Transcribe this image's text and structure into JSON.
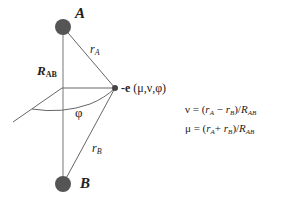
{
  "diagram": {
    "atoms": [
      {
        "id": "A",
        "label": "A",
        "cx": 63,
        "cy": 27,
        "r": 8,
        "color": "#555555"
      },
      {
        "id": "B",
        "label": "B",
        "cx": 63,
        "cy": 184,
        "r": 8,
        "color": "#555555"
      }
    ],
    "electron": {
      "label_prefix": "-e",
      "label_coords": "(μ,ν,φ)",
      "cx": 115,
      "cy": 88,
      "r": 3,
      "color": "#444444"
    },
    "labels": {
      "r_a": {
        "base": "r",
        "sub": "A"
      },
      "r_b": {
        "base": "r",
        "sub": "B"
      },
      "r_ab": {
        "base": "R",
        "sub": "AB"
      },
      "phi": "φ"
    },
    "equations": [
      {
        "lhs": "ν",
        "eq": " = (",
        "a": "r",
        "a_sub": "A",
        "op": " − ",
        "b": "r",
        "b_sub": "B",
        "close": ")/",
        "d": "R",
        "d_sub": "AB"
      },
      {
        "lhs": "μ",
        "eq": " = (",
        "a": "r",
        "a_sub": "A",
        "op": "+ ",
        "b": "r",
        "b_sub": "B",
        "close": ")/",
        "d": "R",
        "d_sub": "AB"
      }
    ],
    "colors": {
      "line": "#666666",
      "atom_fill": "#555555",
      "text": "#222222"
    }
  }
}
